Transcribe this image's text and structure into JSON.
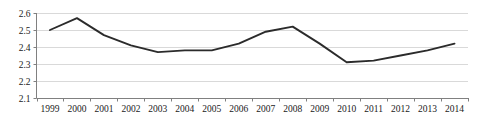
{
  "chart_data": {
    "type": "line",
    "title": "",
    "xlabel": "",
    "ylabel": "",
    "categories": [
      "1999",
      "2000",
      "2001",
      "2002",
      "2003",
      "2004",
      "2005",
      "2006",
      "2007",
      "2008",
      "2009",
      "2010",
      "2011",
      "2012",
      "2013",
      "2014"
    ],
    "values": [
      2.5,
      2.57,
      2.47,
      2.41,
      2.37,
      2.38,
      2.38,
      2.42,
      2.49,
      2.52,
      2.42,
      2.31,
      2.32,
      2.35,
      2.38,
      2.42
    ],
    "series": [
      {
        "name": "",
        "values": [
          2.5,
          2.57,
          2.47,
          2.41,
          2.37,
          2.38,
          2.38,
          2.42,
          2.49,
          2.52,
          2.42,
          2.31,
          2.32,
          2.35,
          2.38,
          2.42
        ]
      }
    ],
    "ylim": [
      2.1,
      2.6
    ],
    "yticks": [
      2.1,
      2.2,
      2.3,
      2.4,
      2.5,
      2.6
    ],
    "ytick_labels": [
      "2.1",
      "2.2",
      "2.3",
      "2.4",
      "2.5",
      "2.6"
    ],
    "grid": true,
    "grid_axis": "y",
    "legend": false,
    "legend_position": "none",
    "markers": false,
    "line_color": "#2b2b2b",
    "grid_color": "#d9d9d9",
    "axis_color": "#808080",
    "background_color": "#ffffff"
  }
}
